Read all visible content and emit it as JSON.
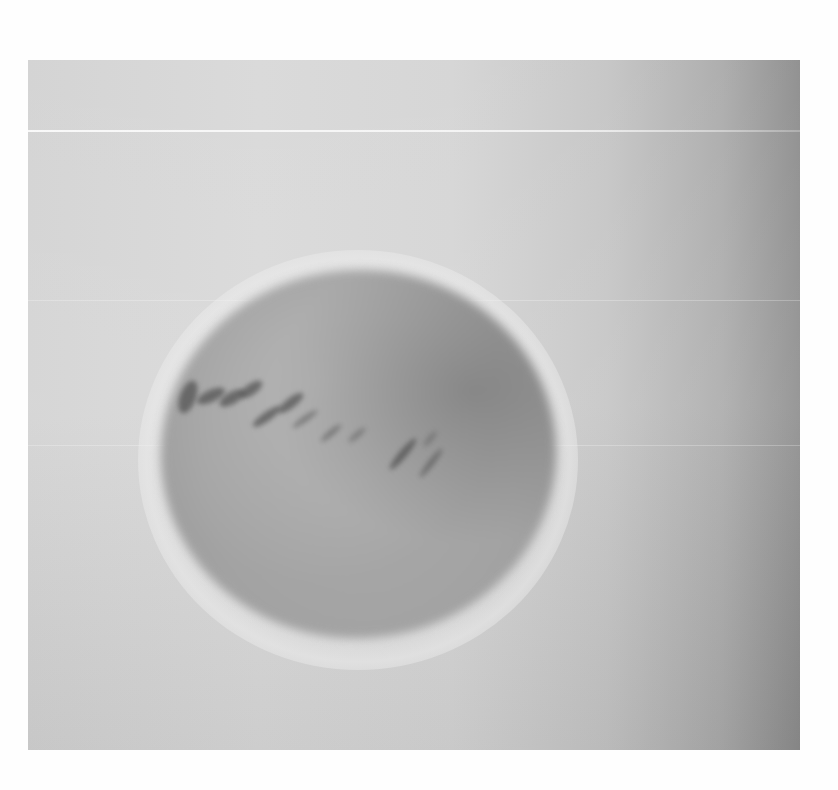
{
  "image": {
    "description": "Grayscale photograph of a blurry sphere with dark diagonal streaks on a gradient background",
    "colors": {
      "page_background": "#fefefe",
      "background_light": "#d8d8d8",
      "background_dark": "#8c8c8c",
      "sphere_mid": "#a3a3a3",
      "streak": "#464646"
    }
  }
}
